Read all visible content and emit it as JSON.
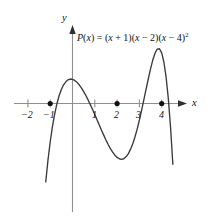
{
  "figure": {
    "equation_plain": "P(x) = (x + 1)(x - 2)(x - 4)^2",
    "equation_parts": {
      "fn_name": "P",
      "fn_var": "x",
      "equals": " = ",
      "factor1_open": "(",
      "factor1_var": "x",
      "factor1_op": " + 1)(",
      "factor2_var": "x",
      "factor2_op": " − 2)(",
      "factor3_var": "x",
      "factor3_op": " − 4)",
      "exponent": "2"
    },
    "x_axis_label": "x",
    "y_axis_label": "y",
    "line_color": "#3a3a3a",
    "axis_color": "#8a8a8a",
    "point_color": "#111111"
  },
  "chart_data": {
    "type": "line",
    "title": "",
    "subtitle": "",
    "xlabel": "x",
    "ylabel": "y",
    "annotations": [
      "P(x) = (x + 1)(x − 2)(x − 4)²"
    ],
    "legend": [],
    "grid": false,
    "xlim": [
      -1.95,
      5.1
    ],
    "ylim": [
      -46,
      33
    ],
    "xticks": [
      -2,
      -1,
      1,
      2,
      3,
      4
    ],
    "xtick_labels": [
      "−2",
      "−1",
      "1",
      "2",
      "3",
      "4"
    ],
    "yticks": [],
    "ytick_labels": [],
    "function": "(x + 1)(x - 2)(x - 4)^2",
    "roots": [
      -1,
      2,
      4
    ],
    "marked_points": [
      {
        "x": -1,
        "y": 0,
        "label": "−1"
      },
      {
        "x": 2,
        "y": 0,
        "label": "2"
      },
      {
        "x": 4,
        "y": 0,
        "label": "4"
      }
    ],
    "local_minimum": {
      "x": 0.0,
      "y": -32
    },
    "local_maximum": {
      "x": 2.9,
      "y": 6.4
    },
    "series": [
      {
        "name": "P(x)",
        "x": [
          -1.9,
          -1.8,
          -1.7,
          -1.6,
          -1.5,
          -1.4,
          -1.3,
          -1.2,
          -1.1,
          -1.0,
          -0.9,
          -0.8,
          -0.7,
          -0.6,
          -0.5,
          -0.4,
          -0.3,
          -0.2,
          -0.1,
          0.0,
          0.1,
          0.2,
          0.3,
          0.4,
          0.5,
          0.6,
          0.7,
          0.8,
          0.9,
          1.0,
          1.1,
          1.2,
          1.3,
          1.4,
          1.5,
          1.6,
          1.7,
          1.8,
          1.9,
          2.0,
          2.1,
          2.2,
          2.3,
          2.4,
          2.5,
          2.6,
          2.7,
          2.8,
          2.9,
          3.0,
          3.1,
          3.2,
          3.3,
          3.4,
          3.5,
          3.6,
          3.7,
          3.8,
          3.9,
          4.0,
          4.1,
          4.2,
          4.3,
          4.4,
          4.5,
          4.6,
          4.7,
          4.8,
          4.9,
          5.0
        ],
        "y": [
          -128.2,
          -108.3,
          -90.6,
          -74.8,
          -60.8,
          -48.5,
          -37.8,
          -28.5,
          -20.6,
          -14.0,
          -8.4,
          -3.9,
          -0.1,
          2.8,
          5.1,
          6.8,
          7.9,
          8.6,
          8.9,
          8.8,
          8.4,
          7.7,
          6.8,
          5.7,
          4.3,
          2.9,
          1.3,
          -0.4,
          -2.2,
          -4.0,
          -5.9,
          -7.8,
          -9.7,
          -11.5,
          -13.3,
          -14.9,
          -16.4,
          -17.7,
          -18.8,
          -19.6,
          -20.1,
          -20.3,
          -20.1,
          -19.4,
          -18.3,
          -16.7,
          -14.7,
          -12.2,
          -9.3,
          -6.0,
          -2.4,
          1.4,
          5.2,
          9.0,
          12.6,
          15.8,
          18.3,
          19.8,
          19.9,
          18.4,
          15.0,
          9.4,
          1.5,
          -9.0,
          -22.1,
          -38.0,
          -56.9,
          -78.8,
          -103.9,
          -132.4
        ]
      }
    ]
  }
}
